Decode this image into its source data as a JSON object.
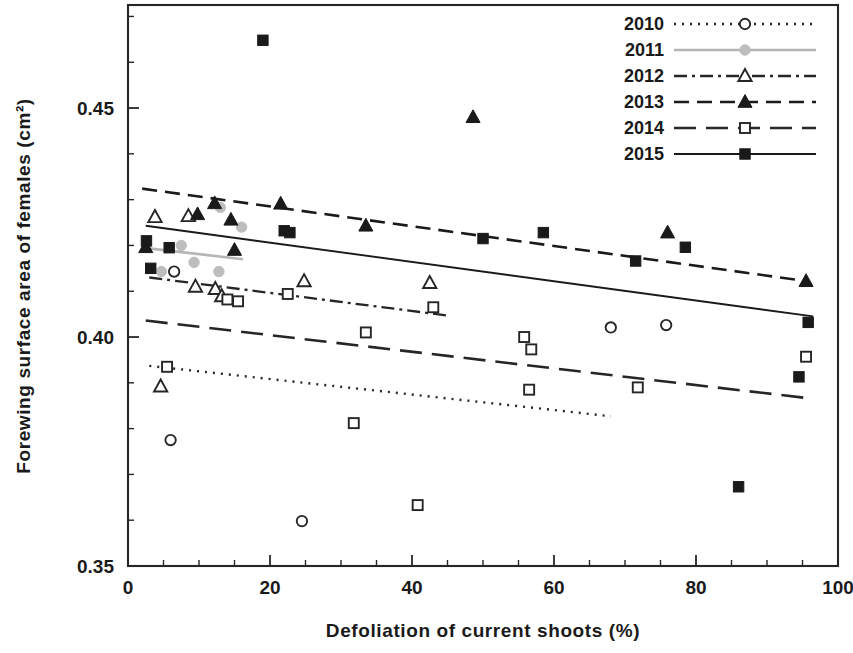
{
  "chart_data": {
    "type": "scatter",
    "title": "",
    "xlabel": "Defoliation of current shoots (%)",
    "ylabel": "Forewing surface area of females (cm²)",
    "xlim": [
      0,
      100
    ],
    "ylim": [
      0.35,
      0.4725
    ],
    "xticks": [
      0,
      20,
      40,
      60,
      80,
      100
    ],
    "xtick_labels": [
      "0",
      "20",
      "40",
      "60",
      "80",
      "100"
    ],
    "xtick_minor_step": 5,
    "yticks": [
      0.35,
      0.4,
      0.45
    ],
    "ytick_labels": [
      "0.35",
      "0.40",
      "0.45"
    ],
    "ytick_minor_step": 0.01,
    "grid": false,
    "legend_position": "top-right",
    "series": [
      {
        "name": "2010",
        "marker": "open-circle",
        "linestyle": "dotted",
        "color": "#262626",
        "points": [
          {
            "x": 6.5,
            "y": 0.4143
          },
          {
            "x": 6.0,
            "y": 0.3775
          },
          {
            "x": 24.5,
            "y": 0.3598
          },
          {
            "x": 68.0,
            "y": 0.4021
          },
          {
            "x": 75.8,
            "y": 0.4026
          }
        ],
        "fit_line": {
          "x1": 3.0,
          "y1": 0.3937,
          "x2": 68.0,
          "y2": 0.3827
        }
      },
      {
        "name": "2011",
        "marker": "filled-circle-gray",
        "linestyle": "solid-gray",
        "color": "#b0b0b0",
        "points": [
          {
            "x": 7.5,
            "y": 0.42
          },
          {
            "x": 9.3,
            "y": 0.4163
          },
          {
            "x": 12.8,
            "y": 0.4143
          },
          {
            "x": 4.7,
            "y": 0.4143
          },
          {
            "x": 13.0,
            "y": 0.4283
          },
          {
            "x": 16.0,
            "y": 0.424
          }
        ],
        "fit_line": {
          "x1": 3.2,
          "y1": 0.4193,
          "x2": 16.2,
          "y2": 0.417
        }
      },
      {
        "name": "2012",
        "marker": "open-triangle",
        "linestyle": "dash-dot",
        "color": "#262626",
        "points": [
          {
            "x": 3.8,
            "y": 0.4262
          },
          {
            "x": 8.5,
            "y": 0.4264
          },
          {
            "x": 4.6,
            "y": 0.3892
          },
          {
            "x": 9.5,
            "y": 0.411
          },
          {
            "x": 12.3,
            "y": 0.4105
          },
          {
            "x": 13.2,
            "y": 0.4089
          },
          {
            "x": 24.8,
            "y": 0.4122
          },
          {
            "x": 42.5,
            "y": 0.4118
          }
        ],
        "fit_line": {
          "x1": 3.0,
          "y1": 0.413,
          "x2": 45.0,
          "y2": 0.4047
        }
      },
      {
        "name": "2013",
        "marker": "filled-triangle",
        "linestyle": "dashed",
        "color": "#1a1a1a",
        "points": [
          {
            "x": 2.5,
            "y": 0.4196
          },
          {
            "x": 9.8,
            "y": 0.4268
          },
          {
            "x": 12.2,
            "y": 0.4292
          },
          {
            "x": 14.5,
            "y": 0.4256
          },
          {
            "x": 15.0,
            "y": 0.419
          },
          {
            "x": 21.5,
            "y": 0.4291
          },
          {
            "x": 33.5,
            "y": 0.4243
          },
          {
            "x": 48.6,
            "y": 0.448
          },
          {
            "x": 76.0,
            "y": 0.4228
          },
          {
            "x": 95.5,
            "y": 0.4122
          }
        ],
        "fit_line": {
          "x1": 2.0,
          "y1": 0.4324,
          "x2": 96.0,
          "y2": 0.4121
        }
      },
      {
        "name": "2014",
        "marker": "open-square",
        "linestyle": "long-dash",
        "color": "#262626",
        "points": [
          {
            "x": 5.5,
            "y": 0.3935
          },
          {
            "x": 14.0,
            "y": 0.4082
          },
          {
            "x": 15.5,
            "y": 0.4078
          },
          {
            "x": 22.5,
            "y": 0.4094
          },
          {
            "x": 31.8,
            "y": 0.3812
          },
          {
            "x": 33.5,
            "y": 0.401
          },
          {
            "x": 40.8,
            "y": 0.3633
          },
          {
            "x": 43.0,
            "y": 0.4065
          },
          {
            "x": 55.8,
            "y": 0.4
          },
          {
            "x": 56.8,
            "y": 0.3973
          },
          {
            "x": 56.5,
            "y": 0.3885
          },
          {
            "x": 71.8,
            "y": 0.389
          },
          {
            "x": 95.5,
            "y": 0.3957
          }
        ],
        "fit_line": {
          "x1": 2.5,
          "y1": 0.4036,
          "x2": 96.0,
          "y2": 0.3866
        }
      },
      {
        "name": "2015",
        "marker": "filled-square",
        "linestyle": "solid",
        "color": "#1a1a1a",
        "points": [
          {
            "x": 2.6,
            "y": 0.421
          },
          {
            "x": 3.2,
            "y": 0.415
          },
          {
            "x": 5.8,
            "y": 0.4195
          },
          {
            "x": 19.0,
            "y": 0.4648
          },
          {
            "x": 22.0,
            "y": 0.4232
          },
          {
            "x": 22.8,
            "y": 0.4228
          },
          {
            "x": 50.0,
            "y": 0.4215
          },
          {
            "x": 58.5,
            "y": 0.4228
          },
          {
            "x": 71.5,
            "y": 0.4166
          },
          {
            "x": 78.5,
            "y": 0.4196
          },
          {
            "x": 86.0,
            "y": 0.3673
          },
          {
            "x": 94.5,
            "y": 0.3913
          },
          {
            "x": 95.8,
            "y": 0.4032
          }
        ],
        "fit_line": {
          "x1": 2.5,
          "y1": 0.4243,
          "x2": 96.5,
          "y2": 0.4045
        }
      }
    ]
  },
  "legend": {
    "entries": [
      {
        "label": "2010"
      },
      {
        "label": "2011"
      },
      {
        "label": "2012"
      },
      {
        "label": "2013"
      },
      {
        "label": "2014"
      },
      {
        "label": "2015"
      }
    ]
  }
}
